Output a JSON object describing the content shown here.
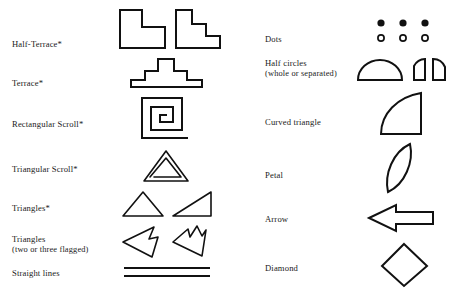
{
  "figure": {
    "type": "motif-glyph-legend",
    "background_color": "#ffffff",
    "ink_color": "#111111",
    "columns": 2
  },
  "left_column": {
    "rows": [
      {
        "label": "Half-Terrace*",
        "sublabel": "",
        "glyph_names": [
          "half-terrace-one-step-glyph",
          "half-terrace-two-step-glyph"
        ],
        "glyph_count": 2
      },
      {
        "label": "Terrace*",
        "sublabel": "",
        "glyph_names": [
          "stepped-terrace-glyph"
        ],
        "glyph_count": 1
      },
      {
        "label": "Rectangular Scroll*",
        "sublabel": "",
        "glyph_names": [
          "rectangular-spiral-glyph"
        ],
        "glyph_count": 1
      },
      {
        "label": "Triangular Scroll*",
        "sublabel": "",
        "glyph_names": [
          "triangular-spiral-glyph"
        ],
        "glyph_count": 1
      },
      {
        "label": "Triangles*",
        "sublabel": "",
        "glyph_names": [
          "isoceles-triangle-glyph",
          "right-triangle-glyph"
        ],
        "glyph_count": 2
      },
      {
        "label": "Triangles",
        "sublabel": "(two or three flagged)",
        "glyph_names": [
          "two-flagged-triangle-glyph",
          "three-flagged-triangle-glyph"
        ],
        "glyph_count": 2
      },
      {
        "label": "Straight lines",
        "sublabel": "",
        "glyph_names": [
          "parallel-straight-lines-glyph"
        ],
        "glyph_count": 1
      }
    ]
  },
  "right_column": {
    "rows": [
      {
        "label": "Dots",
        "sublabel": "",
        "glyph_names": [
          "filled-dot-glyph",
          "open-circle-glyph"
        ],
        "glyph_count": 6,
        "detail": "three filled dots above three open circles"
      },
      {
        "label": "Half circles",
        "sublabel": "(whole or separated)",
        "glyph_names": [
          "semicircle-glyph",
          "quarter-circle-left-glyph",
          "quarter-circle-right-glyph"
        ],
        "glyph_count": 3
      },
      {
        "label": "Curved triangle",
        "sublabel": "",
        "glyph_names": [
          "curved-triangle-glyph"
        ],
        "glyph_count": 1
      },
      {
        "label": "Petal",
        "sublabel": "",
        "glyph_names": [
          "petal-glyph"
        ],
        "glyph_count": 1
      },
      {
        "label": "Arrow",
        "sublabel": "",
        "glyph_names": [
          "left-arrow-glyph"
        ],
        "glyph_count": 1
      },
      {
        "label": "Diamond",
        "sublabel": "",
        "glyph_names": [
          "diamond-glyph"
        ],
        "glyph_count": 1
      }
    ]
  }
}
